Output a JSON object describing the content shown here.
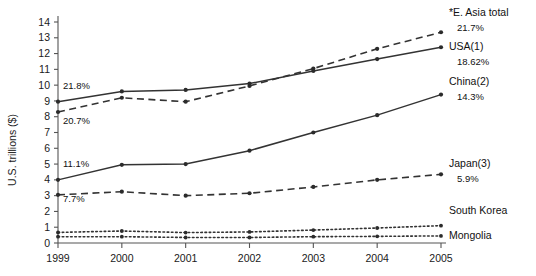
{
  "chart_data": {
    "type": "line",
    "title": "",
    "xlabel": "",
    "ylabel": "U.S. trillions ($)",
    "x": [
      "1999",
      "2000",
      "2001",
      "2002",
      "2003",
      "2004",
      "2005"
    ],
    "xlim": [
      "1999",
      "2005"
    ],
    "ylim": [
      0,
      14
    ],
    "yticks": [
      "0",
      "1",
      "2",
      "3",
      "4",
      "5",
      "6",
      "7",
      "8",
      "9",
      "10",
      "11",
      "12",
      "13",
      "14"
    ],
    "grid": false,
    "legend": "right-inline-labels",
    "series": [
      {
        "name": "*E. Asia total",
        "style": "dashed",
        "end_value_label": "21.7%",
        "start_value_label": "20.7%",
        "values": [
          8.3,
          9.2,
          8.95,
          9.95,
          11.05,
          12.3,
          13.35
        ]
      },
      {
        "name": "USA(1)",
        "style": "solid",
        "end_value_label": "18.62%",
        "start_value_label": "21.8%",
        "values": [
          8.95,
          9.6,
          9.7,
          10.1,
          10.9,
          11.65,
          12.4
        ]
      },
      {
        "name": "China(2)",
        "style": "solid",
        "end_value_label": "14.3%",
        "start_value_label": "11.1%",
        "values": [
          4.0,
          4.95,
          5.0,
          5.85,
          7.0,
          8.1,
          9.4
        ]
      },
      {
        "name": "Japan(3)",
        "style": "dashed",
        "end_value_label": "5.9%",
        "start_value_label": "7.7%",
        "values": [
          3.05,
          3.25,
          3.0,
          3.15,
          3.55,
          4.0,
          4.35
        ]
      },
      {
        "name": "South Korea",
        "style": "dotted",
        "end_value_label": "",
        "start_value_label": "",
        "values": [
          0.67,
          0.76,
          0.66,
          0.7,
          0.82,
          0.95,
          1.1
        ]
      },
      {
        "name": "Mongolia",
        "style": "dotted",
        "end_value_label": "",
        "start_value_label": "",
        "values": [
          0.4,
          0.4,
          0.35,
          0.35,
          0.4,
          0.42,
          0.45
        ]
      }
    ],
    "annotations": [
      {
        "text": "21.8%",
        "series": "USA(1)",
        "position": "left-above"
      },
      {
        "text": "20.7%",
        "series": "*E. Asia total",
        "position": "left-below"
      },
      {
        "text": "11.1%",
        "series": "China(2)",
        "position": "left-above"
      },
      {
        "text": "7.7%",
        "series": "Japan(3)",
        "position": "left-below"
      }
    ],
    "colors": {
      "line": "#333333",
      "axis": "#555555",
      "text": "#111111",
      "background": "#ffffff"
    }
  }
}
